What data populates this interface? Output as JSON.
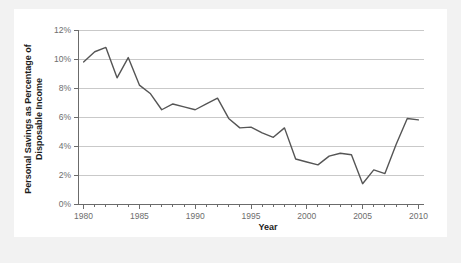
{
  "chart_data": {
    "type": "line",
    "title": "",
    "xlabel": "Year",
    "ylabel": "Personal Savings as Percentage of Disposable Income",
    "ylabel_line1": "Personal Savings as Percentage of",
    "ylabel_line2": "Disposable Income",
    "xlim": [
      1979.5,
      2010.5
    ],
    "ylim": [
      0,
      12
    ],
    "grid": true,
    "legend": false,
    "x_tick_labels": [
      "1980",
      "1985",
      "1990",
      "1995",
      "2000",
      "2005",
      "2010"
    ],
    "x_tick_values": [
      1980,
      1985,
      1990,
      1995,
      2000,
      2005,
      2010
    ],
    "x_minor_tick_values": [
      1980,
      1981,
      1982,
      1983,
      1984,
      1985,
      1986,
      1987,
      1988,
      1989,
      1990,
      1991,
      1992,
      1993,
      1994,
      1995,
      1996,
      1997,
      1998,
      1999,
      2000,
      2001,
      2002,
      2003,
      2004,
      2005,
      2006,
      2007,
      2008,
      2009,
      2010
    ],
    "y_tick_labels": [
      "0%",
      "2%",
      "4%",
      "6%",
      "8%",
      "10%",
      "12%"
    ],
    "y_tick_values": [
      0,
      2,
      4,
      6,
      8,
      10,
      12
    ],
    "line_color": "#555555",
    "grid_color": "#c9c9c9",
    "axis_color": "#6b6b6b",
    "x": [
      1980,
      1981,
      1982,
      1983,
      1984,
      1985,
      1986,
      1987,
      1988,
      1989,
      1990,
      1991,
      1992,
      1993,
      1994,
      1995,
      1996,
      1997,
      1998,
      1999,
      2000,
      2001,
      2002,
      2003,
      2004,
      2005,
      2006,
      2007,
      2008,
      2009,
      2010
    ],
    "values": [
      9.8,
      10.5,
      10.8,
      8.7,
      10.1,
      8.2,
      7.6,
      6.5,
      6.9,
      6.7,
      6.5,
      6.9,
      7.3,
      5.9,
      5.25,
      5.3,
      4.9,
      4.6,
      5.25,
      3.1,
      2.9,
      2.7,
      3.3,
      3.5,
      3.4,
      1.4,
      2.35,
      2.1,
      4.1,
      5.9,
      5.8
    ],
    "data_labels": [
      {
        "year": 1980,
        "value": 9.8
      },
      {
        "year": 1981,
        "value": 10.5
      },
      {
        "year": 1982,
        "value": 10.8
      },
      {
        "year": 1983,
        "value": 8.7
      },
      {
        "year": 1984,
        "value": 10.1
      },
      {
        "year": 1985,
        "value": 8.2
      },
      {
        "year": 1986,
        "value": 7.6
      },
      {
        "year": 1987,
        "value": 6.5
      },
      {
        "year": 1988,
        "value": 6.9
      },
      {
        "year": 1989,
        "value": 6.7
      },
      {
        "year": 1990,
        "value": 6.5
      },
      {
        "year": 1991,
        "value": 6.9
      },
      {
        "year": 1992,
        "value": 7.3
      },
      {
        "year": 1993,
        "value": 5.9
      },
      {
        "year": 1994,
        "value": 5.25
      },
      {
        "year": 1995,
        "value": 5.3
      },
      {
        "year": 1996,
        "value": 4.9
      },
      {
        "year": 1997,
        "value": 4.6
      },
      {
        "year": 1998,
        "value": 5.25
      },
      {
        "year": 1999,
        "value": 3.1
      },
      {
        "year": 2000,
        "value": 2.9
      },
      {
        "year": 2001,
        "value": 2.7
      },
      {
        "year": 2002,
        "value": 3.3
      },
      {
        "year": 2003,
        "value": 3.5
      },
      {
        "year": 2004,
        "value": 3.4
      },
      {
        "year": 2005,
        "value": 1.4
      },
      {
        "year": 2006,
        "value": 2.35
      },
      {
        "year": 2007,
        "value": 2.1
      },
      {
        "year": 2008,
        "value": 4.1
      },
      {
        "year": 2009,
        "value": 5.9
      },
      {
        "year": 2010,
        "value": 5.8
      }
    ]
  }
}
